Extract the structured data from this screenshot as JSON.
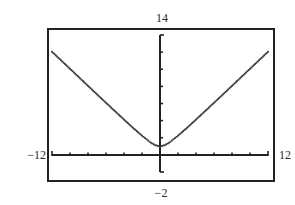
{
  "window": {
    "xmin": "−12",
    "xmax": "12",
    "ymin": "−2",
    "ymax": "14"
  },
  "colors": {
    "frame": "#222222",
    "axis": "#222222",
    "curve": "#333333",
    "background": "#ffffff"
  },
  "chart_data": {
    "type": "line",
    "title": "",
    "xlabel": "",
    "ylabel": "",
    "xlim": [
      -12,
      12
    ],
    "ylim": [
      -2,
      14
    ],
    "xscale_tick": 2,
    "yscale_tick": 2,
    "grid": false,
    "legend": null,
    "tick_labels": {
      "x_left": "−12",
      "x_right": "12",
      "y_bottom": "−2",
      "y_top": "14"
    },
    "series": [
      {
        "name": "y = sqrt(x^2 + 1)",
        "style": "dotted",
        "x": [
          -12,
          -11,
          -10,
          -9,
          -8,
          -7,
          -6,
          -5,
          -4,
          -3,
          -2,
          -1,
          -0.5,
          0,
          0.5,
          1,
          2,
          3,
          4,
          5,
          6,
          7,
          8,
          9,
          10,
          11,
          12
        ],
        "y": [
          12.04,
          11.05,
          10.05,
          9.06,
          8.06,
          7.07,
          6.08,
          5.1,
          4.12,
          3.16,
          2.24,
          1.41,
          1.12,
          1.0,
          1.12,
          1.41,
          2.24,
          3.16,
          4.12,
          5.1,
          6.08,
          7.07,
          8.06,
          9.06,
          10.05,
          11.05,
          12.04
        ]
      }
    ]
  },
  "layout": {
    "frame": {
      "x": 48,
      "y": 29,
      "w": 226,
      "h": 152
    },
    "plot": {
      "x0": 52,
      "x1": 268,
      "y_top": 35,
      "y_bottom": 172
    }
  }
}
